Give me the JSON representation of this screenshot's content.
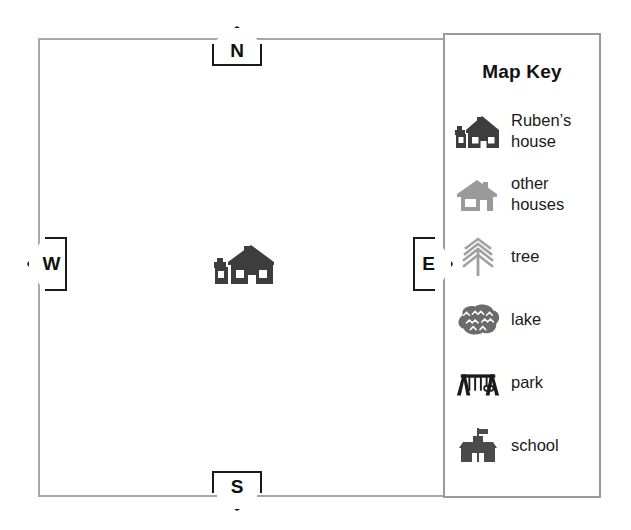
{
  "map": {
    "compass": {
      "north": "N",
      "south": "S",
      "west": "W",
      "east": "E"
    },
    "features": [
      {
        "icon": "rubens-house-icon",
        "name": "Ruben's house"
      }
    ]
  },
  "map_key": {
    "title": "Map Key",
    "entries": [
      {
        "icon": "rubens-house-icon",
        "label": "Ruben’s house",
        "color": "#3d3d3d"
      },
      {
        "icon": "other-houses-icon",
        "label": "other houses",
        "color": "#9a9a9a"
      },
      {
        "icon": "tree-icon",
        "label": "tree",
        "color": "#a0a0a0"
      },
      {
        "icon": "lake-icon",
        "label": "lake",
        "color": "#6b6b6b"
      },
      {
        "icon": "park-icon",
        "label": "park",
        "color": "#1a1a1a"
      },
      {
        "icon": "school-icon",
        "label": "school",
        "color": "#4a4a4a"
      }
    ]
  },
  "colors": {
    "frame_border": "#a8a8a8",
    "key_border": "#9a9a9a",
    "compass_border": "#1a1a1a",
    "text": "#111111",
    "background": "#ffffff"
  }
}
